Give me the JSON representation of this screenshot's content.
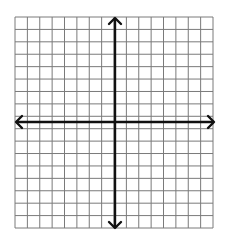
{
  "diagram": {
    "type": "coordinate-plane",
    "grid": {
      "left": 15,
      "top": 17,
      "right": 213,
      "bottom": 228,
      "columns": 16,
      "rows": 17,
      "line_color": "#7a7a7a"
    },
    "axes": {
      "x_axis_y": 122,
      "y_axis_x": 115,
      "color": "#111111",
      "x_arrows": [
        "left",
        "right"
      ],
      "y_arrows": [
        "up",
        "down"
      ]
    }
  }
}
